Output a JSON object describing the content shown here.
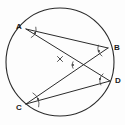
{
  "figure": {
    "background_color": "#fdfdfd",
    "stroke_color": "#2b2b2b",
    "label_color": "#1a1a1a"
  },
  "circle": {
    "name": "circumference",
    "cx": 60,
    "cy": 62,
    "r": 54,
    "stroke_width": 1.1
  },
  "center_mark": {
    "name": "center-cross",
    "glyph": "×",
    "cx": 60,
    "cy": 59,
    "size": 5
  },
  "points": [
    {
      "id": "A",
      "label": "A",
      "x": 26,
      "y": 29,
      "label_x": 16,
      "label_y": 29
    },
    {
      "id": "B",
      "label": "B",
      "x": 108,
      "y": 48,
      "label_x": 114,
      "label_y": 50
    },
    {
      "id": "D",
      "label": "D",
      "x": 110,
      "y": 81,
      "label_x": 115,
      "label_y": 83
    },
    {
      "id": "C",
      "label": "C",
      "x": 26,
      "y": 104,
      "label_x": 16,
      "label_y": 110
    }
  ],
  "chords": [
    {
      "id": "AB",
      "label": "AB",
      "from": "A",
      "to": "B"
    },
    {
      "id": "AD",
      "label": "AD",
      "from": "A",
      "to": "D"
    },
    {
      "id": "CB",
      "label": "CB",
      "from": "C",
      "to": "B"
    },
    {
      "id": "CD",
      "label": "CD",
      "from": "C",
      "to": "D"
    }
  ],
  "angle_marks": [
    {
      "id": "angle-A",
      "at": "A",
      "label": "angle BAD",
      "arc_cx": 26,
      "arc_cy": 29,
      "arc_r": 10,
      "dot_x": 35,
      "dot_y": 33
    },
    {
      "id": "angle-B",
      "at": "B",
      "label": "angle ABC",
      "arc_cx": 108,
      "arc_cy": 48,
      "arc_r": 10,
      "dot_x": 99,
      "dot_y": 51
    },
    {
      "id": "angle-D",
      "at": "D",
      "label": "angle ADC",
      "arc_cx": 110,
      "arc_cy": 81,
      "arc_r": 10,
      "dot_x": 100,
      "dot_y": 79
    },
    {
      "id": "angle-C",
      "at": "C",
      "label": "angle BCD",
      "arc_cx": 26,
      "arc_cy": 104,
      "arc_r": 13,
      "dot_x": 38,
      "dot_y": 99
    },
    {
      "id": "angle-X",
      "at": "intersection",
      "label": "angle at chord intersection",
      "arc_cx": 78,
      "arc_cy": 65,
      "arc_r": 6,
      "dot_x": 73,
      "dot_y": 65
    }
  ]
}
